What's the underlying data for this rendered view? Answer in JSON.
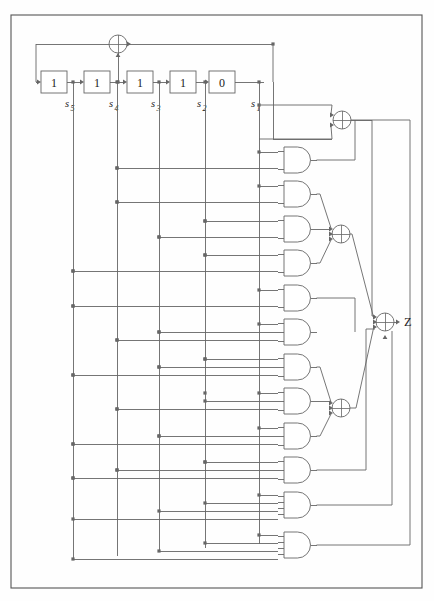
{
  "figure": {
    "type": "logic-circuit-diagram",
    "background_color": "#fefefe",
    "line_color": "#666666",
    "text_color": "#222222",
    "border": {
      "x": 11,
      "y": 15,
      "width": 411,
      "height": 573
    }
  },
  "shift_register": {
    "label_prefix": "s",
    "cells": [
      {
        "value": "1",
        "label": "s",
        "subscript": "5",
        "x": 41,
        "y": 71,
        "tap_x": 73
      },
      {
        "value": "1",
        "label": "s",
        "subscript": "4",
        "x": 84,
        "y": 71,
        "tap_x": 117
      },
      {
        "value": "1",
        "label": "s",
        "subscript": "3",
        "x": 127,
        "y": 71,
        "tap_x": 159
      },
      {
        "value": "1",
        "label": "s",
        "subscript": "2",
        "x": 170,
        "y": 71,
        "tap_x": 205
      },
      {
        "value": "0",
        "label": "s",
        "subscript": "1",
        "x": 209,
        "y": 71,
        "tap_x": 259
      }
    ],
    "cell_width": 26,
    "cell_height": 22
  },
  "xor_gates": [
    {
      "name": "feedback-xor",
      "cx": 118,
      "cy": 44,
      "r": 9,
      "inputs": 2
    },
    {
      "name": "xor-top",
      "cx": 342,
      "cy": 120,
      "r": 9,
      "inputs": 4
    },
    {
      "name": "xor-middle",
      "cx": 341,
      "cy": 234,
      "r": 9,
      "inputs": 4
    },
    {
      "name": "xor-lower",
      "cx": 341,
      "cy": 408,
      "r": 9,
      "inputs": 4
    },
    {
      "name": "xor-output",
      "cx": 385,
      "cy": 322,
      "r": 9,
      "inputs": 4
    }
  ],
  "and_gates": [
    {
      "index": 1,
      "y": 160,
      "inputs": 2
    },
    {
      "index": 2,
      "y": 194,
      "inputs": 2
    },
    {
      "index": 3,
      "y": 229,
      "inputs": 2
    },
    {
      "index": 4,
      "y": 263,
      "inputs": 2
    },
    {
      "index": 5,
      "y": 298,
      "inputs": 2
    },
    {
      "index": 6,
      "y": 332,
      "inputs": 3
    },
    {
      "index": 7,
      "y": 367,
      "inputs": 3
    },
    {
      "index": 8,
      "y": 401,
      "inputs": 3
    },
    {
      "index": 9,
      "y": 436,
      "inputs": 3
    },
    {
      "index": 10,
      "y": 470,
      "inputs": 3
    },
    {
      "index": 11,
      "y": 505,
      "inputs": 4
    },
    {
      "index": 12,
      "y": 545,
      "inputs": 4
    }
  ],
  "output": {
    "label": "Z",
    "x": 404,
    "y": 322
  }
}
